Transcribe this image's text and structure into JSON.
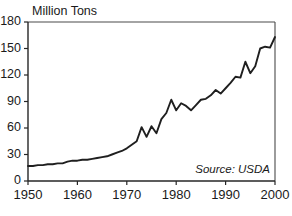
{
  "chart_data": {
    "type": "line",
    "title": "",
    "ylabel": "Million Tons",
    "xlabel": "",
    "annotation": "Source: USDA",
    "grid": false,
    "legend": false,
    "xlim": [
      1950,
      2000
    ],
    "ylim": [
      0,
      180
    ],
    "xticks": [
      1950,
      1960,
      1970,
      1980,
      1990,
      2000
    ],
    "xtick_labels": [
      "1950",
      "1960",
      "1970",
      "1980",
      "1990",
      "2000"
    ],
    "yticks": [
      0,
      30,
      60,
      90,
      120,
      150,
      180
    ],
    "ytick_labels": [
      "0",
      "30",
      "60",
      "90",
      "120",
      "150",
      "180"
    ],
    "line_color": "#1f1f1f",
    "x": [
      1950,
      1951,
      1952,
      1953,
      1954,
      1955,
      1956,
      1957,
      1958,
      1959,
      1960,
      1961,
      1962,
      1963,
      1964,
      1965,
      1966,
      1967,
      1968,
      1969,
      1970,
      1971,
      1972,
      1973,
      1974,
      1975,
      1976,
      1977,
      1978,
      1979,
      1980,
      1981,
      1982,
      1983,
      1984,
      1985,
      1986,
      1987,
      1988,
      1989,
      1990,
      1991,
      1992,
      1993,
      1994,
      1995,
      1996,
      1997,
      1998,
      1999,
      2000
    ],
    "values": [
      17,
      17,
      18,
      18,
      19,
      19,
      20,
      20,
      22,
      23,
      23,
      24,
      24,
      25,
      26,
      27,
      28,
      30,
      32,
      34,
      37,
      41,
      45,
      61,
      50,
      62,
      54,
      70,
      77,
      92,
      80,
      88,
      85,
      80,
      86,
      92,
      93,
      97,
      103,
      99,
      105,
      111,
      118,
      117,
      135,
      122,
      130,
      150,
      152,
      151,
      163
    ],
    "series": [
      {
        "name": "Million Tons",
        "values": [
          17,
          17,
          18,
          18,
          19,
          19,
          20,
          20,
          22,
          23,
          23,
          24,
          24,
          25,
          26,
          27,
          28,
          30,
          32,
          34,
          37,
          41,
          45,
          61,
          50,
          62,
          54,
          70,
          77,
          92,
          80,
          88,
          85,
          80,
          86,
          92,
          93,
          97,
          103,
          99,
          105,
          111,
          118,
          117,
          135,
          122,
          130,
          150,
          152,
          151,
          163
        ]
      }
    ]
  },
  "figure": {
    "ylabel": "Million Tons",
    "source": "Source: USDA"
  }
}
